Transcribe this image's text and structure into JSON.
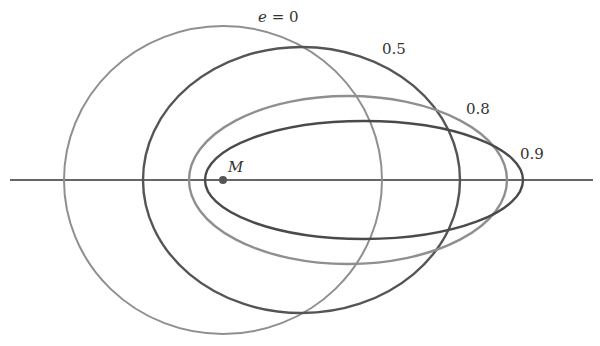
{
  "diagram": {
    "focus_label": "M",
    "axis": {
      "x1": 10,
      "x2": 593,
      "y": 180
    },
    "focus": {
      "x": 223,
      "y": 180,
      "r": 4,
      "color": "#555555"
    },
    "orbits": [
      {
        "name": "e-0",
        "label": "e = 0",
        "cx": 223,
        "cy": 180,
        "rx": 159,
        "ry": 154,
        "color": "#8f8f8f",
        "width": 2
      },
      {
        "name": "e-0.5",
        "label": "0.5",
        "cx": 301.5,
        "cy": 180,
        "rx": 158.5,
        "ry": 133,
        "color": "#555555",
        "width": 2.4
      },
      {
        "name": "e-0.8",
        "label": "0.8",
        "cx": 348,
        "cy": 180,
        "rx": 159,
        "ry": 84,
        "color": "#8f8f8f",
        "width": 2.4
      },
      {
        "name": "e-0.9",
        "label": "0.9",
        "cx": 364,
        "cy": 180,
        "rx": 159,
        "ry": 59,
        "color": "#4a4a4a",
        "width": 2.4
      }
    ],
    "labels": {
      "e0_var": "e",
      "e0_rest": " = 0",
      "e05": "0.5",
      "e08": "0.8",
      "e09": "0.9",
      "m": "M"
    }
  }
}
